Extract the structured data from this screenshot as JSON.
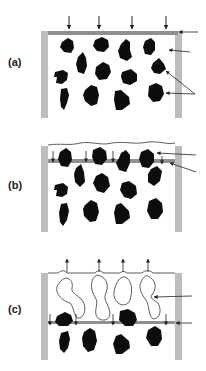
{
  "figure": {
    "panels": [
      {
        "id": "a",
        "label": "(a)"
      },
      {
        "id": "b",
        "label": "(b)"
      },
      {
        "id": "c",
        "label": "(c)"
      }
    ],
    "colors": {
      "wall": "#bdbdbd",
      "plate": "#8f8f8f",
      "particle": "#0d0d0d",
      "line": "#333333",
      "background": "#ffffff"
    }
  }
}
